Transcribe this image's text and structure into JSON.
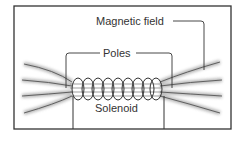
{
  "diagram": {
    "labels": {
      "magnetic_field": "Magnetic field",
      "poles": "Poles",
      "solenoid": "Solenoid"
    },
    "colors": {
      "frame": "#333333",
      "line": "#444444",
      "field_shade": "#9a9a9a",
      "background": "#ffffff"
    },
    "coil_turns": 9
  }
}
